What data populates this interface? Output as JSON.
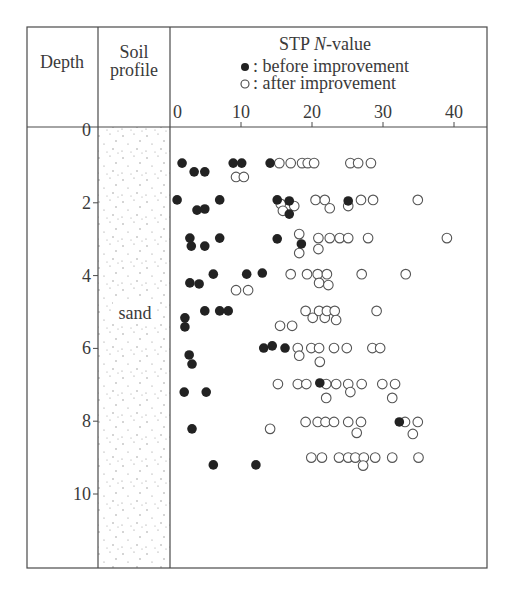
{
  "header": {
    "depth_label": "Depth",
    "soil_label_line1": "Soil",
    "soil_label_line2": "profile",
    "title_prefix": "STP ",
    "title_italic": "N",
    "title_suffix": "-value",
    "legend_before": ": before improvement",
    "legend_after": ": after improvement"
  },
  "soil": {
    "label": "sand"
  },
  "colors": {
    "line": "#4a4a4a",
    "filled": "#222222",
    "open_stroke": "#555555",
    "dot": "#8a8a8a"
  },
  "chart_data": {
    "type": "scatter",
    "title": "STP N-value",
    "xlabel": "STP N-value",
    "ylabel": "Depth",
    "xlim": [
      0,
      44
    ],
    "ylim": [
      0,
      12
    ],
    "y_inverted": true,
    "x_ticks": [
      0,
      10,
      20,
      30,
      40
    ],
    "y_ticks": [
      0,
      2,
      4,
      6,
      8,
      10
    ],
    "grid": false,
    "legend_position": "top (header cell)",
    "soil_profile": [
      {
        "from": 0,
        "to": 12,
        "type": "sand"
      }
    ],
    "series": [
      {
        "name": "before improvement",
        "marker": "filled-circle",
        "points": [
          [
            1.7,
            0.91
          ],
          [
            8.9,
            0.91
          ],
          [
            10.1,
            0.91
          ],
          [
            14.1,
            0.91
          ],
          [
            3.4,
            1.15
          ],
          [
            4.9,
            1.15
          ],
          [
            1.0,
            1.92
          ],
          [
            3.8,
            2.2
          ],
          [
            4.9,
            2.17
          ],
          [
            7.0,
            1.92
          ],
          [
            15.1,
            1.92
          ],
          [
            16.8,
            1.95
          ],
          [
            16.8,
            2.31
          ],
          [
            25.1,
            1.95
          ],
          [
            2.8,
            2.97
          ],
          [
            3.0,
            3.19
          ],
          [
            4.9,
            3.19
          ],
          [
            7.0,
            2.97
          ],
          [
            15.1,
            2.99
          ],
          [
            18.5,
            3.13
          ],
          [
            2.8,
            4.2
          ],
          [
            4.1,
            4.23
          ],
          [
            6.1,
            3.96
          ],
          [
            10.8,
            3.96
          ],
          [
            13.0,
            3.93
          ],
          [
            2.1,
            5.16
          ],
          [
            2.1,
            5.41
          ],
          [
            4.9,
            4.97
          ],
          [
            7.0,
            4.97
          ],
          [
            8.2,
            4.97
          ],
          [
            2.7,
            6.18
          ],
          [
            3.1,
            6.43
          ],
          [
            13.2,
            5.99
          ],
          [
            14.4,
            5.93
          ],
          [
            16.2,
            5.99
          ],
          [
            2.0,
            7.2
          ],
          [
            5.1,
            7.2
          ],
          [
            21.1,
            6.95
          ],
          [
            3.1,
            8.21
          ],
          [
            32.3,
            8.02
          ],
          [
            6.1,
            9.2
          ],
          [
            12.1,
            9.2
          ]
        ]
      },
      {
        "name": "after improvement",
        "marker": "open-circle",
        "points": [
          [
            15.4,
            0.91
          ],
          [
            17.0,
            0.91
          ],
          [
            18.6,
            0.91
          ],
          [
            19.4,
            0.91
          ],
          [
            20.3,
            0.91
          ],
          [
            25.4,
            0.91
          ],
          [
            26.5,
            0.91
          ],
          [
            28.3,
            0.91
          ],
          [
            9.3,
            1.29
          ],
          [
            10.4,
            1.29
          ],
          [
            15.6,
            2.03
          ],
          [
            15.9,
            2.22
          ],
          [
            17.5,
            2.09
          ],
          [
            20.5,
            1.92
          ],
          [
            21.8,
            1.92
          ],
          [
            22.5,
            2.15
          ],
          [
            25.1,
            2.09
          ],
          [
            26.9,
            1.92
          ],
          [
            28.6,
            1.92
          ],
          [
            34.9,
            1.92
          ],
          [
            18.2,
            2.86
          ],
          [
            18.2,
            3.38
          ],
          [
            20.9,
            2.97
          ],
          [
            20.9,
            3.27
          ],
          [
            22.5,
            2.97
          ],
          [
            23.9,
            2.97
          ],
          [
            25.1,
            2.97
          ],
          [
            27.9,
            2.97
          ],
          [
            39.0,
            2.97
          ],
          [
            17.0,
            3.96
          ],
          [
            19.3,
            3.96
          ],
          [
            20.8,
            3.96
          ],
          [
            22.1,
            3.96
          ],
          [
            21.0,
            4.2
          ],
          [
            22.3,
            4.26
          ],
          [
            27.0,
            3.96
          ],
          [
            33.2,
            3.96
          ],
          [
            9.3,
            4.4
          ],
          [
            11.0,
            4.4
          ],
          [
            19.1,
            4.97
          ],
          [
            20.1,
            5.16
          ],
          [
            21.0,
            4.97
          ],
          [
            21.8,
            5.16
          ],
          [
            22.1,
            4.97
          ],
          [
            23.2,
            4.97
          ],
          [
            23.4,
            5.22
          ],
          [
            29.1,
            4.97
          ],
          [
            15.5,
            5.38
          ],
          [
            17.2,
            5.38
          ],
          [
            18.0,
            5.99
          ],
          [
            18.2,
            6.2
          ],
          [
            19.9,
            5.99
          ],
          [
            21.0,
            5.99
          ],
          [
            21.1,
            6.37
          ],
          [
            23.1,
            5.99
          ],
          [
            24.9,
            5.99
          ],
          [
            28.5,
            5.99
          ],
          [
            29.6,
            5.99
          ],
          [
            15.2,
            6.98
          ],
          [
            18.0,
            6.98
          ],
          [
            19.2,
            6.98
          ],
          [
            22.0,
            6.98
          ],
          [
            22.0,
            7.36
          ],
          [
            23.4,
            6.98
          ],
          [
            25.1,
            6.98
          ],
          [
            25.4,
            7.2
          ],
          [
            27.0,
            6.98
          ],
          [
            29.9,
            6.98
          ],
          [
            31.7,
            6.98
          ],
          [
            31.3,
            7.36
          ],
          [
            14.1,
            8.21
          ],
          [
            19.1,
            8.02
          ],
          [
            20.8,
            8.02
          ],
          [
            21.9,
            8.02
          ],
          [
            23.1,
            8.02
          ],
          [
            25.1,
            8.02
          ],
          [
            26.9,
            8.02
          ],
          [
            26.3,
            8.32
          ],
          [
            33.1,
            8.02
          ],
          [
            34.9,
            8.02
          ],
          [
            34.2,
            8.35
          ],
          [
            19.9,
            9.0
          ],
          [
            21.4,
            9.0
          ],
          [
            23.8,
            9.0
          ],
          [
            25.1,
            9.0
          ],
          [
            26.1,
            9.0
          ],
          [
            27.3,
            9.0
          ],
          [
            27.2,
            9.22
          ],
          [
            28.9,
            9.0
          ],
          [
            31.3,
            9.0
          ],
          [
            35.0,
            9.0
          ]
        ]
      }
    ]
  }
}
